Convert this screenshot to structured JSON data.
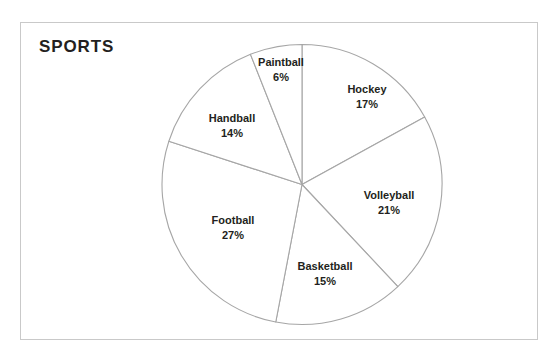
{
  "chart_title": "SPORTS",
  "frame": {
    "border_color": "#c9c9c9",
    "background": "#ffffff"
  },
  "chart_data": {
    "type": "pie",
    "title": "SPORTS",
    "xlabel": "",
    "ylabel": "",
    "legend_position": "none",
    "grid": false,
    "start_angle_deg": 0,
    "direction": "clockwise",
    "slice_fill": "#ffffff",
    "slice_stroke": "#a6a6a6",
    "categories": [
      "Hockey",
      "Volleyball",
      "Basketball",
      "Football",
      "Handball",
      "Paintball"
    ],
    "values": [
      17,
      21,
      15,
      27,
      14,
      6
    ],
    "value_unit": "%",
    "slices": [
      {
        "name": "Hockey",
        "value": 17,
        "label": "Hockey",
        "percent_label": "17%",
        "label_x": 367,
        "label_y": 97
      },
      {
        "name": "Volleyball",
        "value": 21,
        "label": "Volleyball",
        "percent_label": "21%",
        "label_x": 389,
        "label_y": 203
      },
      {
        "name": "Basketball",
        "value": 15,
        "label": "Basketball",
        "percent_label": "15%",
        "label_x": 325,
        "label_y": 274
      },
      {
        "name": "Football",
        "value": 27,
        "label": "Football",
        "percent_label": "27%",
        "label_x": 233,
        "label_y": 228
      },
      {
        "name": "Handball",
        "value": 14,
        "label": "Handball",
        "percent_label": "14%",
        "label_x": 232,
        "label_y": 126
      },
      {
        "name": "Paintball",
        "value": 6,
        "label": "Paintball",
        "percent_label": "6%",
        "label_x": 281,
        "label_y": 70
      }
    ]
  }
}
